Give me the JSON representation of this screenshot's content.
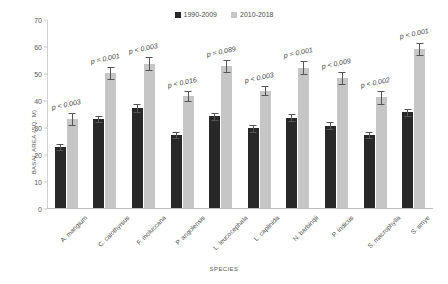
{
  "chart_data": {
    "type": "bar",
    "title": "",
    "xlabel": "SPECIES",
    "ylabel": "BASAL AREA (SQ. M)",
    "ylim": [
      0,
      70
    ],
    "ytick_step": 10,
    "yticks": [
      "0",
      "10",
      "20",
      "30",
      "40",
      "50",
      "60",
      "70"
    ],
    "grid": false,
    "legend_position": "top-center",
    "categories": [
      "A. mangium",
      "C. calothyrsus",
      "F. moluccana",
      "P. angolensis",
      "L. leucocephala",
      "L. caplinida",
      "N. barbinqii",
      "P. indicus",
      "S. macrophylla",
      "S. smye"
    ],
    "series": [
      {
        "name": "1990-2009",
        "color": "#282828",
        "values": [
          22.5,
          33,
          37,
          27,
          34,
          29.5,
          33.5,
          30.5,
          27,
          35.5
        ],
        "errors": [
          1.2,
          1.2,
          1.6,
          1.0,
          1.3,
          1.2,
          1.3,
          1.3,
          1.2,
          1.3
        ]
      },
      {
        "name": "2010-2018",
        "color": "#c6c6c6",
        "values": [
          33,
          50,
          53.5,
          41.5,
          52.5,
          43.5,
          52,
          48,
          41,
          59
        ],
        "errors": [
          2.2,
          2.4,
          2.3,
          1.7,
          2.2,
          1.6,
          2.3,
          2.2,
          2.3,
          2.3
        ]
      }
    ],
    "annotations": [
      "p < 0.003",
      "p = 0.001",
      "p < 0.003",
      "p < 0.016",
      "p = 0.089",
      "p < 0.003",
      "p = 0.001",
      "p < 0.009",
      "p < 0.002",
      "p < 0.001"
    ]
  }
}
